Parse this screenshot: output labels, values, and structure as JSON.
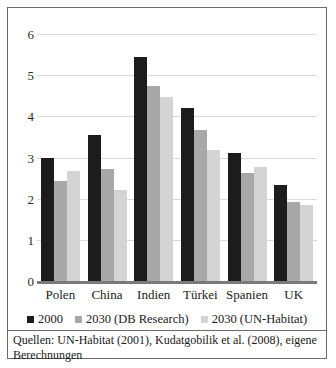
{
  "chart_data": {
    "type": "bar",
    "title": "",
    "xlabel": "",
    "ylabel": "",
    "ylim": [
      0,
      6
    ],
    "yticks": [
      "0",
      "1",
      "2",
      "3",
      "4",
      "5",
      "6"
    ],
    "grid": true,
    "legend_position": "bottom",
    "categories": [
      "Polen",
      "China",
      "Indien",
      "Türkei",
      "Spanien",
      "UK"
    ],
    "series": [
      {
        "name": "2000",
        "color": "#1c1c1c",
        "values": [
          3.0,
          3.55,
          5.45,
          4.2,
          3.1,
          2.33
        ]
      },
      {
        "name": "2030 (DB Research)",
        "color": "#a8a8a8",
        "values": [
          2.43,
          2.72,
          4.73,
          3.68,
          2.62,
          1.93
        ]
      },
      {
        "name": "2030 (UN-Habitat)",
        "color": "#d4d4d4",
        "values": [
          2.68,
          2.22,
          4.48,
          3.18,
          2.78,
          1.85
        ]
      }
    ]
  },
  "source": {
    "note": "Quellen: UN-Habitat (2001), Kudatgobilik et al. (2008), eigene Berechnungen"
  }
}
